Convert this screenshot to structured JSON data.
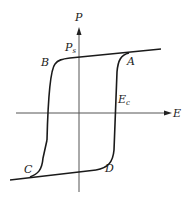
{
  "diagram": {
    "type": "ferroelectric-hysteresis-loop",
    "axes": {
      "vertical": {
        "label": "P"
      },
      "horizontal": {
        "label": "E"
      }
    },
    "annotations": {
      "saturation_polarization": {
        "main": "P",
        "sub": "s"
      },
      "coercive_field": {
        "main": "E",
        "sub": "c"
      }
    },
    "points": [
      {
        "id": "A",
        "label": "A"
      },
      {
        "id": "B",
        "label": "B"
      },
      {
        "id": "C",
        "label": "C"
      },
      {
        "id": "D",
        "label": "D"
      }
    ],
    "colors": {
      "curve": "#1a1a1a",
      "axis": "#555555",
      "background": "#ffffff"
    }
  }
}
